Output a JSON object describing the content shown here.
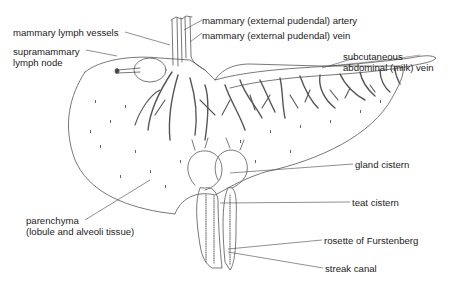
{
  "diagram": {
    "colors": {
      "line": "#555555",
      "leader": "#444444",
      "background": "#ffffff",
      "text": "#1c1c1c"
    },
    "labels": [
      {
        "id": "lymph-vessels",
        "lines": [
          "mammary lymph vessels"
        ]
      },
      {
        "id": "artery",
        "lines": [
          "mammary (external pudendal) artery"
        ]
      },
      {
        "id": "vein",
        "lines": [
          "mammary (external pudendal) vein"
        ]
      },
      {
        "id": "lymph-node",
        "lines": [
          "supramammary",
          "lymph node"
        ]
      },
      {
        "id": "milk-vein",
        "lines": [
          "subcutaneous",
          "abdominal (milk) vein"
        ]
      },
      {
        "id": "gland-cistern",
        "lines": [
          "gland cistern"
        ]
      },
      {
        "id": "teat-cistern",
        "lines": [
          "teat cistern"
        ]
      },
      {
        "id": "parenchyma",
        "lines": [
          "parenchyma",
          "(lobule and alveoli tissue)"
        ]
      },
      {
        "id": "rosette",
        "lines": [
          "rosette of Furstenberg"
        ]
      },
      {
        "id": "streak-canal",
        "lines": [
          "streak canal"
        ]
      }
    ]
  }
}
